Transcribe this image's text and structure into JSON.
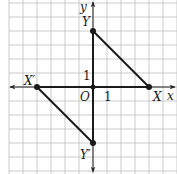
{
  "figure": {
    "type": "coordinate-grid-diagram",
    "grid": {
      "origin_px": [
        93,
        87
      ],
      "unit_px": 14,
      "x_range": [
        -6,
        6
      ],
      "y_range": [
        -6,
        6
      ],
      "line_color": "#bdbdbd",
      "axis_color": "#222222",
      "segment_color": "#1a1a1a"
    },
    "axes": {
      "x_label": "x",
      "y_label": "y",
      "origin_label": "O",
      "x_unit_label": "1",
      "y_unit_label": "1"
    },
    "points": [
      {
        "name": "X",
        "label": "X",
        "x": 4,
        "y": 0
      },
      {
        "name": "Y",
        "label": "Y",
        "x": 0,
        "y": 4
      },
      {
        "name": "O",
        "label": "O",
        "x": 0,
        "y": 0
      },
      {
        "name": "X'",
        "label": "X′",
        "x": -4,
        "y": 0
      },
      {
        "name": "Y'",
        "label": "Y′",
        "x": 0,
        "y": -4
      }
    ],
    "segments": [
      {
        "from": "X",
        "to": "Y"
      },
      {
        "from": "O",
        "to": "Y"
      },
      {
        "from": "O",
        "to": "X"
      },
      {
        "from": "X'",
        "to": "Y'"
      },
      {
        "from": "O",
        "to": "X'"
      },
      {
        "from": "O",
        "to": "Y'"
      }
    ],
    "labels": {
      "X": "X",
      "Y": "Y",
      "Xp": "X′",
      "Yp": "Y′"
    }
  }
}
